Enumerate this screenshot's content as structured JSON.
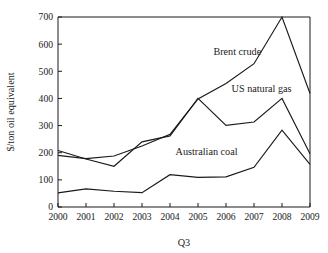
{
  "chart_data": {
    "type": "line",
    "title": "",
    "xlabel": "Q3",
    "ylabel": "$/ton oil equivalent",
    "x": [
      2000,
      2001,
      2002,
      2003,
      2004,
      2005,
      2006,
      2007,
      2008,
      2009
    ],
    "xtick_labels": [
      "2000",
      "2001",
      "2002",
      "2003",
      "2004",
      "2005",
      "2006",
      "2007",
      "2008",
      "2009"
    ],
    "ytick_labels": [
      "0",
      "100",
      "200",
      "300",
      "400",
      "500",
      "600",
      "700"
    ],
    "yticks": [
      0,
      100,
      200,
      300,
      400,
      500,
      600,
      700
    ],
    "xlim": [
      2000,
      2009
    ],
    "ylim": [
      0,
      700
    ],
    "grid": false,
    "legend": "inline-annotations",
    "series": [
      {
        "name": "Brent crude",
        "label": "Brent crude",
        "color": "#1a1a1a",
        "values": [
          190,
          178,
          188,
          225,
          268,
          398,
          455,
          528,
          700,
          418
        ]
      },
      {
        "name": "US natural gas",
        "label": "US natural gas",
        "color": "#1a1a1a",
        "values": [
          208,
          177,
          150,
          240,
          262,
          400,
          301,
          313,
          400,
          196
        ]
      },
      {
        "name": "Australian coal",
        "label": "Australian coal",
        "color": "#1a1a1a",
        "values": [
          52,
          67,
          58,
          53,
          119,
          109,
          111,
          146,
          283,
          157
        ]
      }
    ],
    "annotations": [
      {
        "text": "Brent crude",
        "x": 2005.55,
        "y": 560
      },
      {
        "text": "US natural gas",
        "x": 2006.2,
        "y": 425
      },
      {
        "text": "Australian coal",
        "x": 2004.2,
        "y": 190
      }
    ]
  }
}
